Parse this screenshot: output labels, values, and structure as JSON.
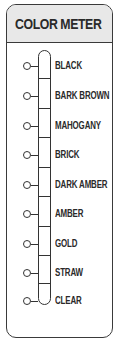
{
  "title": "COLOR METER",
  "levels": [
    {
      "label": "BLACK",
      "icon": "circle-marker-icon"
    },
    {
      "label": "BARK BROWN",
      "icon": "circle-marker-icon"
    },
    {
      "label": "MAHOGANY",
      "icon": "circle-marker-icon"
    },
    {
      "label": "BRICK",
      "icon": "circle-marker-icon"
    },
    {
      "label": "DARK AMBER",
      "icon": "circle-marker-icon"
    },
    {
      "label": "AMBER",
      "icon": "circle-marker-icon"
    },
    {
      "label": "GOLD",
      "icon": "circle-marker-icon"
    },
    {
      "label": "STRAW",
      "icon": "circle-marker-icon"
    },
    {
      "label": "CLEAR",
      "icon": "circle-marker-icon"
    }
  ],
  "colors": {
    "header_bg": "#e8e8e8",
    "border": "#3a3a3a",
    "text": "#2a2a2a"
  }
}
